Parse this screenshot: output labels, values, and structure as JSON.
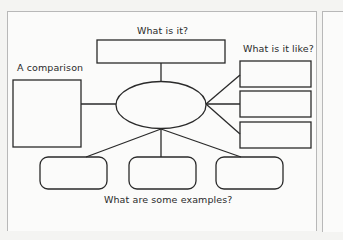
{
  "diagram": {
    "type": "concept-map",
    "labels": {
      "top": "What is it?",
      "left": "A comparison",
      "right": "What is it like?",
      "bottom": "What are some examples?"
    },
    "nodes": {
      "center": {
        "shape": "ellipse",
        "text": ""
      },
      "what_is_it": {
        "shape": "rectangle",
        "text": ""
      },
      "comparison": {
        "shape": "rectangle",
        "text": ""
      },
      "like": [
        {
          "shape": "rectangle",
          "text": ""
        },
        {
          "shape": "rectangle",
          "text": ""
        },
        {
          "shape": "rectangle",
          "text": ""
        }
      ],
      "examples": [
        {
          "shape": "rounded-rectangle",
          "text": ""
        },
        {
          "shape": "rounded-rectangle",
          "text": ""
        },
        {
          "shape": "rounded-rectangle",
          "text": ""
        }
      ]
    },
    "colors": {
      "stroke": "#2a2a2a",
      "background": "#fbfbfa"
    }
  }
}
